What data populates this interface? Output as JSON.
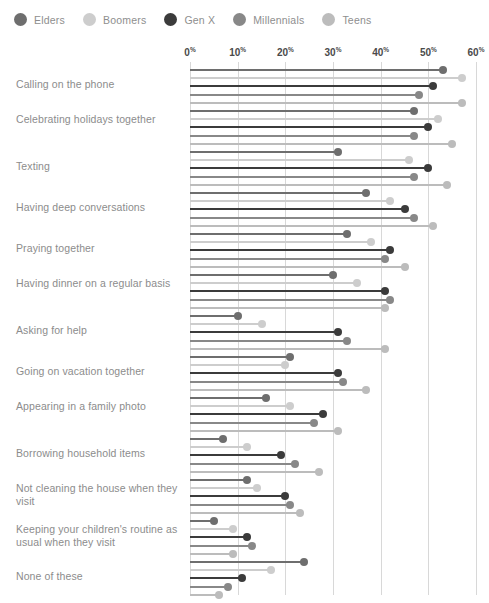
{
  "legend": {
    "items": [
      {
        "label": "Elders",
        "color": "#6e6e6e"
      },
      {
        "label": "Boomers",
        "color": "#cdcdcd"
      },
      {
        "label": "Gen X",
        "color": "#3b3b3b"
      },
      {
        "label": "Millennials",
        "color": "#888888"
      },
      {
        "label": "Teens",
        "color": "#bcbcbc"
      }
    ]
  },
  "axis": {
    "ticks": [
      "0",
      "10",
      "20",
      "30",
      "40",
      "50",
      "60"
    ],
    "suffix": "%",
    "min": 0,
    "max": 60,
    "step": 10
  },
  "chart_data": {
    "type": "bar",
    "title": "",
    "subtitle": "",
    "xlabel": "",
    "ylabel": "",
    "xlim": [
      0,
      60
    ],
    "grid": true,
    "legend_position": "top-left",
    "orientation": "horizontal",
    "style": "lollipop",
    "categories": [
      "Calling on the phone",
      "Celebrating holidays together",
      "Texting",
      "Having deep conversations",
      "Praying together",
      "Having dinner on a regular basis",
      "Asking for help",
      "Going on vacation together",
      "Appearing in a family photo",
      "Borrowing household items",
      "Not cleaning the house when they visit",
      "Keeping your children's routine as usual when they visit",
      "None of these"
    ],
    "series": [
      {
        "name": "Elders",
        "color": "#6e6e6e",
        "values": [
          53,
          47,
          31,
          37,
          33,
          30,
          10,
          21,
          16,
          7,
          12,
          5,
          24
        ]
      },
      {
        "name": "Boomers",
        "color": "#cdcdcd",
        "values": [
          57,
          52,
          46,
          42,
          38,
          35,
          15,
          20,
          21,
          12,
          14,
          9,
          17
        ]
      },
      {
        "name": "Gen X",
        "color": "#3b3b3b",
        "values": [
          51,
          50,
          50,
          45,
          42,
          41,
          31,
          31,
          28,
          19,
          20,
          12,
          11
        ]
      },
      {
        "name": "Millennials",
        "color": "#888888",
        "values": [
          48,
          47,
          47,
          47,
          41,
          42,
          33,
          32,
          26,
          22,
          21,
          13,
          8
        ]
      },
      {
        "name": "Teens",
        "color": "#bcbcbc",
        "values": [
          57,
          55,
          54,
          51,
          45,
          41,
          41,
          37,
          31,
          27,
          23,
          9,
          6
        ]
      }
    ]
  }
}
